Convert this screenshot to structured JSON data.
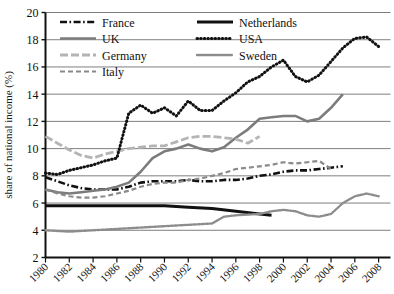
{
  "chart_data": {
    "type": "line",
    "title": "",
    "xlabel": "",
    "ylabel": "share of national income (%)",
    "xlim": [
      1980,
      2009
    ],
    "ylim": [
      2,
      20
    ],
    "ytick_step": 2,
    "grid": "horizontal",
    "legend_position": "top-left-inside",
    "ytick_labels": [
      "2",
      "4",
      "6",
      "8",
      "10",
      "12",
      "14",
      "16",
      "18",
      "20"
    ],
    "ytick_values": [
      2,
      4,
      6,
      8,
      10,
      12,
      14,
      16,
      18,
      20
    ],
    "xtick_labels": [
      "1980",
      "1982",
      "1984",
      "1986",
      "1988",
      "1990",
      "1992",
      "1994",
      "1996",
      "1998",
      "2000",
      "2002",
      "2004",
      "2006",
      "2008"
    ],
    "xtick_values": [
      1980,
      1982,
      1984,
      1986,
      1988,
      1990,
      1992,
      1994,
      1996,
      1998,
      2000,
      2002,
      2004,
      2006,
      2008
    ],
    "series": [
      {
        "name": "France",
        "style": "dashdot",
        "color": "#111111",
        "width": 2.6,
        "dasharray": "7,2.5,1.6,2.5",
        "x": [
          1980,
          1981,
          1982,
          1983,
          1984,
          1985,
          1986,
          1987,
          1988,
          1989,
          1990,
          1991,
          1992,
          1993,
          1994,
          1995,
          1996,
          1997,
          1998,
          1999,
          2000,
          2001,
          2002,
          2003,
          2004,
          2005
        ],
        "y": [
          7.9,
          7.6,
          7.3,
          7.1,
          7.0,
          7.0,
          7.0,
          7.2,
          7.5,
          7.6,
          7.6,
          7.6,
          7.7,
          7.6,
          7.6,
          7.7,
          7.7,
          7.8,
          8.0,
          8.1,
          8.3,
          8.4,
          8.4,
          8.5,
          8.6,
          8.7
        ]
      },
      {
        "name": "UK",
        "style": "solid",
        "color": "#7c7c7c",
        "width": 2.6,
        "dasharray": "",
        "x": [
          1980,
          1981,
          1982,
          1983,
          1984,
          1985,
          1986,
          1987,
          1988,
          1989,
          1990,
          1991,
          1992,
          1993,
          1994,
          1995,
          1996,
          1997,
          1998,
          1999,
          2000,
          2001,
          2002,
          2003,
          2004,
          2005
        ],
        "y": [
          7.0,
          6.8,
          6.7,
          6.8,
          6.9,
          7.0,
          7.2,
          7.5,
          8.3,
          9.3,
          9.8,
          10.0,
          10.3,
          10.0,
          9.8,
          10.1,
          10.8,
          11.4,
          12.2,
          12.3,
          12.4,
          12.4,
          12.0,
          12.2,
          13.0,
          14.0
        ]
      },
      {
        "name": "Germany",
        "style": "dashed",
        "color": "#b4b4b4",
        "width": 2.8,
        "dasharray": "8,3",
        "x": [
          1980,
          1981,
          1982,
          1983,
          1984,
          1985,
          1986,
          1987,
          1988,
          1989,
          1990,
          1991,
          1992,
          1993,
          1994,
          1995,
          1996,
          1997,
          1998
        ],
        "y": [
          10.9,
          10.4,
          9.9,
          9.5,
          9.3,
          9.6,
          9.8,
          10.0,
          10.1,
          10.2,
          10.2,
          10.5,
          10.8,
          10.9,
          10.9,
          10.8,
          10.7,
          10.4,
          10.9
        ]
      },
      {
        "name": "Italy",
        "style": "dashed",
        "color": "#8a8a8a",
        "width": 2.2,
        "dasharray": "5,3",
        "x": [
          1980,
          1981,
          1982,
          1983,
          1984,
          1985,
          1986,
          1987,
          1988,
          1989,
          1990,
          1991,
          1992,
          1993,
          1994,
          1995,
          1996,
          1997,
          1998,
          1999,
          2000,
          2001,
          2002,
          2003,
          2004
        ],
        "y": [
          7.0,
          6.7,
          6.5,
          6.4,
          6.4,
          6.5,
          6.7,
          6.9,
          7.2,
          7.4,
          7.5,
          7.5,
          7.7,
          7.8,
          8.0,
          8.2,
          8.5,
          8.6,
          8.7,
          8.8,
          9.0,
          8.9,
          9.0,
          9.1,
          8.5
        ]
      },
      {
        "name": "Netherlands",
        "style": "solid",
        "color": "#111111",
        "width": 3.0,
        "dasharray": "",
        "x": [
          1980,
          1982,
          1984,
          1986,
          1988,
          1990,
          1992,
          1994,
          1996,
          1998,
          1999
        ],
        "y": [
          5.8,
          5.8,
          5.8,
          5.8,
          5.8,
          5.8,
          5.7,
          5.6,
          5.4,
          5.2,
          5.1
        ]
      },
      {
        "name": "USA",
        "style": "dotted",
        "color": "#111111",
        "width": 3.0,
        "dasharray": "0.6,3.0",
        "x": [
          1980,
          1981,
          1982,
          1983,
          1984,
          1985,
          1986,
          1987,
          1988,
          1989,
          1990,
          1991,
          1992,
          1993,
          1994,
          1995,
          1996,
          1997,
          1998,
          1999,
          2000,
          2001,
          2002,
          2003,
          2004,
          2005,
          2006,
          2007,
          2008
        ],
        "y": [
          8.2,
          8.1,
          8.4,
          8.6,
          8.8,
          9.1,
          9.3,
          12.6,
          13.2,
          12.6,
          13.0,
          12.4,
          13.5,
          12.8,
          12.8,
          13.5,
          14.1,
          14.9,
          15.3,
          16.0,
          16.5,
          15.3,
          14.9,
          15.4,
          16.4,
          17.4,
          18.1,
          18.2,
          17.5
        ]
      },
      {
        "name": "Sweden",
        "style": "dotted",
        "color": "#8c8c8c",
        "width": 2.4,
        "dasharray": "1,1.6",
        "x": [
          1980,
          1982,
          1984,
          1986,
          1988,
          1990,
          1992,
          1994,
          1995,
          1996,
          1998,
          1999,
          2000,
          2001,
          2002,
          2003,
          2004,
          2005,
          2006,
          2007,
          2008
        ],
        "y": [
          4.0,
          3.9,
          4.0,
          4.1,
          4.2,
          4.3,
          4.4,
          4.5,
          5.0,
          5.1,
          5.2,
          5.4,
          5.5,
          5.4,
          5.1,
          5.0,
          5.2,
          6.0,
          6.5,
          6.7,
          6.5
        ]
      }
    ],
    "legend": {
      "columns": [
        [
          "France",
          "UK",
          "Germany",
          "Italy"
        ],
        [
          "Netherlands",
          "USA",
          "Sweden"
        ]
      ]
    }
  }
}
